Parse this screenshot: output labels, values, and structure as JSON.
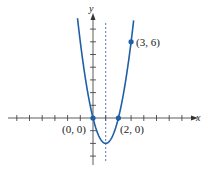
{
  "chart_data": {
    "type": "line",
    "title": "",
    "equation": "y = 2x^2 - 4x",
    "xlabel": "x",
    "ylabel": "y",
    "xlim": [
      -6.5,
      8
    ],
    "ylim": [
      -3.7,
      8
    ],
    "grid": false,
    "tick_step": 1,
    "axis_of_symmetry": 1,
    "vertex": [
      1,
      -2
    ],
    "series": [
      {
        "name": "parabola",
        "color": "#1f5fa8",
        "x": [
          -1.2,
          -1,
          -0.5,
          0,
          0.5,
          1,
          1.5,
          2,
          2.5,
          3,
          3.2
        ],
        "y": [
          7.68,
          6,
          2.5,
          0,
          -1.5,
          -2,
          -1.5,
          0,
          2.5,
          6,
          7.68
        ]
      }
    ],
    "points": [
      {
        "x": 0,
        "y": 0,
        "label": "(0, 0)"
      },
      {
        "x": 2,
        "y": 0,
        "label": "(2, 0)"
      },
      {
        "x": 3,
        "y": 6,
        "label": "(3, 6)"
      }
    ]
  },
  "labels": {
    "x_axis": "x",
    "y_axis": "y",
    "p1": "(0, 0)",
    "p2": "(2, 0)",
    "p3": "(3, 6)"
  }
}
